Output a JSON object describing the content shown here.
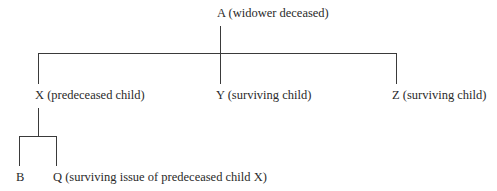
{
  "diagram": {
    "type": "family-tree",
    "root": {
      "label": "A (widower deceased)"
    },
    "children": [
      {
        "label": "X (predeceased child)"
      },
      {
        "label": "Y (surviving child)"
      },
      {
        "label": "Z (surviving child)"
      }
    ],
    "grandchildren": [
      {
        "label": "B"
      },
      {
        "label": "Q (surviving issue of predeceased child X)"
      }
    ]
  }
}
